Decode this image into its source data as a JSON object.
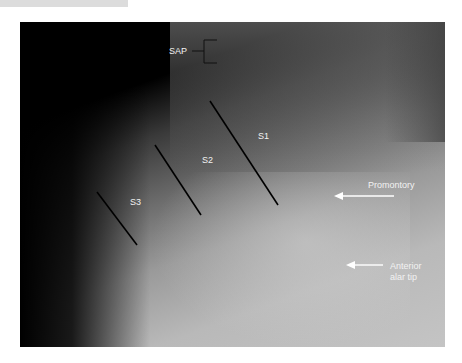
{
  "figure": {
    "labels": {
      "sap": "SAP",
      "s1": "S1",
      "s2": "S2",
      "s3": "S3",
      "promontory": "Promontory",
      "anterior_alar_tip_line1": "Anterior",
      "anterior_alar_tip_line2": "alar tip"
    },
    "colors": {
      "label_text": "#f2f2f2",
      "marker_lines": "#000000",
      "arrows": "#ffffff"
    }
  }
}
